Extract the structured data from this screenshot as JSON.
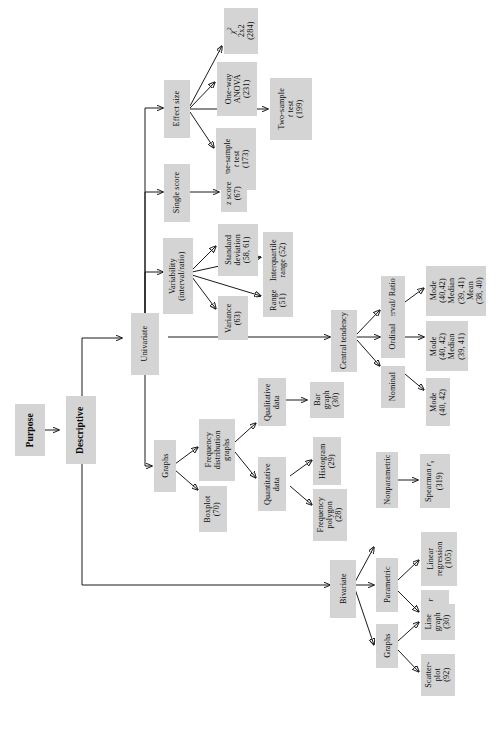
{
  "diagram": {
    "orientation": "rotated-90-counterclockwise",
    "box_fill": "#d4d4d4",
    "line_color": "#1a1a1a",
    "nodes": {
      "purpose": "Purpose",
      "descriptive": "Descriptive",
      "univariate": "Univariate",
      "bivariate": "Bivariate",
      "effect_size": "Effect size",
      "single_score": "Single score",
      "variability": "Variability\n(interval/ratio)",
      "variability_l1": "Variability",
      "variability_l2": "(interval/ratio)",
      "central_tendency": "Central tendency",
      "graphs_uni": "Graphs",
      "graphs_bi": "Graphs",
      "chi_square_l1": "2x2",
      "chi_square_l2": "(284)",
      "one_way_anova_l1": "One-way",
      "one_way_anova_l2": "ANOVA",
      "one_way_anova_l3": "(231)",
      "one_sample_t_l1": "One-sample",
      "one_sample_t_l2": "test",
      "one_sample_t_l3": "(173)",
      "two_sample_t_l1": "Two-sample",
      "two_sample_t_l2": "test",
      "two_sample_t_l3": "(199)",
      "z_score_l1": "score",
      "z_score_l2": "(67)",
      "standard_deviation_l1": "Standard",
      "standard_deviation_l2": "deviation",
      "standard_deviation_l3": "(58, 61)",
      "interquartile_l1": "Interquartile",
      "interquartile_l2": "range (52)",
      "range_l1": "Range",
      "range_l2": "(51)",
      "variance_l1": "Variance",
      "variance_l2": "(63)",
      "interval_ratio": "Interval/ Ratio",
      "ordinal": "Ordinal",
      "nominal": "Nominal",
      "ir_stats_l1": "Mode",
      "ir_stats_l2": "(40,42)",
      "ir_stats_l3": "Median",
      "ir_stats_l4": "(39, 41)",
      "ir_stats_l5": "Mean",
      "ir_stats_l6": "(38, 40)",
      "ord_stats_l1": "Mode",
      "ord_stats_l2": "(40, 42)",
      "ord_stats_l3": "Median",
      "ord_stats_l4": "(39, 41)",
      "nom_stats_l1": "Mode",
      "nom_stats_l2": "(40, 42)",
      "freq_dist_graphs_l1": "Frequency",
      "freq_dist_graphs_l2": "distribution",
      "freq_dist_graphs_l3": "graphs",
      "boxplot_l1": "Boxplot",
      "boxplot_l2": "(70)",
      "qualitative_l1": "Qualitative",
      "qualitative_l2": "data",
      "quantitative_l1": "Quantitative",
      "quantitative_l2": "data",
      "bar_graph_l1": "Bar",
      "bar_graph_l2": "graph",
      "bar_graph_l3": "(30)",
      "histogram_l1": "Histogram",
      "histogram_l2": "(29)",
      "freq_polygon_l1": "Frequency",
      "freq_polygon_l2": "polygon",
      "freq_polygon_l3": "(28)",
      "nonparametric": "Nonparametric",
      "parametric": "Parametric",
      "spearman_l1": "Spearman",
      "spearman_l2": "(319)",
      "linear_regression_l1": "Linear",
      "linear_regression_l2": "regression",
      "linear_regression_l3": "(105)",
      "pearson_l1": "Pearson",
      "pearson_l2": "(89)",
      "line_graph_l1": "Line",
      "line_graph_l2": "graph",
      "line_graph_l3": "(30)",
      "scatterplot_l1": "Scatter-",
      "scatterplot_l2": "plot",
      "scatterplot_l3": "(92)"
    }
  }
}
